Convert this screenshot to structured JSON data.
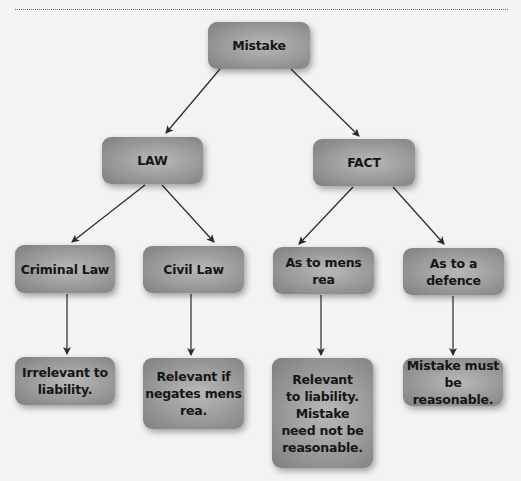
{
  "diagram": {
    "title": "Mistake",
    "colors": {
      "node_fill": "#a0a0a0",
      "text": "#161616",
      "edge": "#2a2a2a",
      "background": "#f3f3f2"
    },
    "nodes": {
      "root": {
        "label": "Mistake"
      },
      "law": {
        "label": "LAW"
      },
      "fact": {
        "label": "FACT"
      },
      "criminal_law": {
        "label": "Criminal Law"
      },
      "civil_law": {
        "label": "Civil Law"
      },
      "mens_rea": {
        "label": "As to mens rea"
      },
      "defence": {
        "label": "As to a defence"
      },
      "criminal_outcome": {
        "label": "Irrelevant to\nliability."
      },
      "civil_outcome": {
        "label": "Relevant if\nnegates mens\nrea."
      },
      "mens_rea_outcome": {
        "label": "Relevant\nto liability.\nMistake\nneed not be\nreasonable."
      },
      "defence_outcome": {
        "label": "Mistake must\nbe reasonable."
      }
    },
    "edges": [
      {
        "from": "root",
        "to": "law"
      },
      {
        "from": "root",
        "to": "fact"
      },
      {
        "from": "law",
        "to": "criminal_law"
      },
      {
        "from": "law",
        "to": "civil_law"
      },
      {
        "from": "fact",
        "to": "mens_rea"
      },
      {
        "from": "fact",
        "to": "defence"
      },
      {
        "from": "criminal_law",
        "to": "criminal_outcome"
      },
      {
        "from": "civil_law",
        "to": "civil_outcome"
      },
      {
        "from": "mens_rea",
        "to": "mens_rea_outcome"
      },
      {
        "from": "defence",
        "to": "defence_outcome"
      }
    ]
  }
}
